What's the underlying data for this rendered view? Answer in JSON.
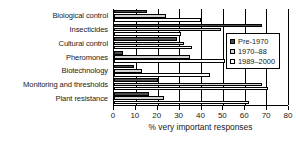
{
  "chart_data": {
    "type": "bar",
    "orientation": "horizontal",
    "title": "",
    "xlabel": "% very important responses",
    "ylabel": "",
    "xlim": [
      0,
      80
    ],
    "xticks": [
      0,
      10,
      20,
      30,
      40,
      50,
      60,
      70,
      80
    ],
    "xtick_labels": [
      "0",
      "10",
      "20",
      "30",
      "40",
      "50",
      "60",
      "70",
      "80"
    ],
    "grid": true,
    "grid_axis": "x",
    "legend_position": "right",
    "categories": [
      "Biological control",
      "Insecticides",
      "Cultural control",
      "Pheromones",
      "Biotechnology",
      "Monitoring and thresholds",
      "Plant resistance"
    ],
    "series": [
      {
        "name": "Pre-1970",
        "color": "#4a4a4a",
        "values": [
          15,
          68,
          29,
          4,
          9,
          20,
          16
        ]
      },
      {
        "name": "1970–88",
        "color": "#d2d2d2",
        "values": [
          24,
          49,
          32,
          35,
          13,
          68,
          23
        ]
      },
      {
        "name": "1989–2000",
        "color": "#ffffff",
        "values": [
          40,
          31,
          36,
          51,
          44,
          71,
          62
        ]
      }
    ]
  },
  "legend": {
    "entries": [
      {
        "label": "Pre-1970"
      },
      {
        "label": "1970–88"
      },
      {
        "label": "1989–2000"
      }
    ]
  },
  "axis": {
    "x_title": "% very important responses"
  }
}
